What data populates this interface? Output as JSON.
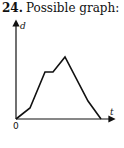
{
  "problem": {
    "number": "24.",
    "title": "Possible graph:"
  },
  "chart_data": {
    "type": "line",
    "title": "Possible graph:",
    "xlabel": "t",
    "ylabel": "d",
    "origin_label": "0",
    "grid": false,
    "legend": false,
    "ticks": "none",
    "x": [
      0,
      14,
      29,
      37,
      49,
      72,
      85
    ],
    "y": [
      0,
      11,
      47,
      47,
      62,
      18,
      0
    ],
    "pixel_points": [
      [
        16,
        119
      ],
      [
        30,
        108
      ],
      [
        45,
        72
      ],
      [
        53,
        72
      ],
      [
        65,
        57
      ],
      [
        88,
        101
      ],
      [
        101,
        119
      ]
    ],
    "axes": {
      "y_axis": {
        "x": 16,
        "y_top": 22,
        "y_bottom": 119
      },
      "x_axis": {
        "y": 119,
        "x_left": 16,
        "x_right": 112
      }
    },
    "stroke_color": "#111111"
  }
}
